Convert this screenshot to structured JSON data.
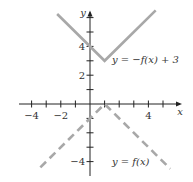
{
  "chart_data": {
    "type": "line",
    "title": "",
    "xlabel": "x",
    "ylabel": "y",
    "xlim": [
      -5,
      6.3
    ],
    "ylim": [
      -5,
      6.5
    ],
    "grid": false,
    "x_ticks": [
      -4,
      -3,
      -2,
      -1,
      1,
      2,
      3,
      4,
      5
    ],
    "y_ticks": [
      -4,
      -3,
      -2,
      -1,
      1,
      2,
      3,
      4,
      5,
      6
    ],
    "x_tick_labels": [
      {
        "value": -4,
        "text": "−4"
      },
      {
        "value": -2,
        "text": "−2"
      },
      {
        "value": 4,
        "text": "4"
      }
    ],
    "y_tick_labels": [
      {
        "value": 4,
        "text": "4"
      },
      {
        "value": 2,
        "text": "2"
      },
      {
        "value": -4,
        "text": "−4"
      }
    ],
    "series": [
      {
        "name": "y = −f(x) + 3",
        "style": "solid",
        "color": "#a8a8a8",
        "x": [
          -2.25,
          1,
          4.5
        ],
        "y": [
          6.25,
          3,
          6.5
        ]
      },
      {
        "name": "y = f(x)",
        "style": "dashed",
        "color": "#a8a8a8",
        "x": [
          -3.4,
          1,
          5.5
        ],
        "y": [
          -4.4,
          0,
          -4.5
        ]
      }
    ],
    "annotations": [
      {
        "text": "y = −f(x) + 3",
        "x": 1.5,
        "y": 3.1
      },
      {
        "text": "y = f(x)",
        "x": 1.5,
        "y": -4.0
      }
    ]
  }
}
